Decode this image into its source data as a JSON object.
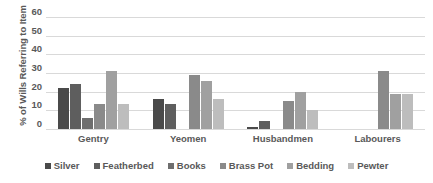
{
  "chart_data": {
    "type": "bar",
    "title": "",
    "xlabel": "",
    "ylabel": "% of Wills Referring to Item",
    "ylim": [
      0,
      60
    ],
    "yticks": [
      60,
      50,
      40,
      30,
      20,
      10,
      0
    ],
    "grid": true,
    "legend_position": "bottom",
    "categories": [
      "Gentry",
      "Yeomen",
      "Husbandmen",
      "Labourers"
    ],
    "series": [
      {
        "name": "Silver",
        "color": "#4a4a4a",
        "values": [
          22,
          16,
          1,
          0
        ]
      },
      {
        "name": "Featherbed",
        "color": "#5e5e5e",
        "values": [
          24,
          13.5,
          4.5,
          0
        ]
      },
      {
        "name": "Books",
        "color": "#6e6e6e",
        "values": [
          6,
          0,
          0,
          0
        ]
      },
      {
        "name": "Brass Pot",
        "color": "#8a8a8a",
        "values": [
          13.5,
          29,
          15,
          31
        ]
      },
      {
        "name": "Bedding",
        "color": "#a0a0a0",
        "values": [
          31,
          25.5,
          20,
          19
        ]
      },
      {
        "name": "Pewter",
        "color": "#bdbdbd",
        "values": [
          13.5,
          16,
          10,
          19
        ]
      }
    ]
  }
}
